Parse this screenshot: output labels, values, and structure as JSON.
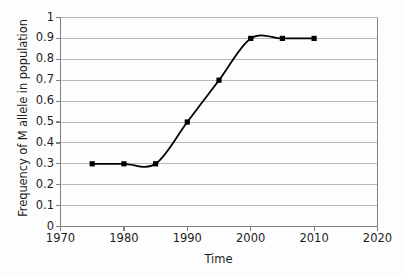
{
  "chart_data": {
    "type": "line",
    "title": "",
    "xlabel": "Time",
    "ylabel": "Frequency of M allele in population",
    "xlim": [
      1970,
      2020
    ],
    "ylim": [
      0,
      1
    ],
    "grid": true,
    "grid_axis": "y",
    "legend": "none",
    "smoothing": "spline",
    "marker": "filled-square",
    "marker_color": "#000000",
    "line_color": "#000000",
    "gridline_color": "#b9b9b9",
    "axis_color": "#808080",
    "background_color": "#ffffff",
    "x": [
      1975,
      1980,
      1985,
      1990,
      1995,
      2000,
      2005,
      2010
    ],
    "values": [
      0.3,
      0.3,
      0.3,
      0.5,
      0.7,
      0.9,
      0.9,
      0.9
    ],
    "series": [
      {
        "name": "Frequency of M allele",
        "points": [
          {
            "x": 1975,
            "y": 0.3
          },
          {
            "x": 1980,
            "y": 0.3
          },
          {
            "x": 1985,
            "y": 0.3
          },
          {
            "x": 1990,
            "y": 0.5
          },
          {
            "x": 1995,
            "y": 0.7
          },
          {
            "x": 2000,
            "y": 0.9
          },
          {
            "x": 2005,
            "y": 0.9
          },
          {
            "x": 2010,
            "y": 0.9
          }
        ]
      }
    ],
    "xticks": [
      1970,
      1980,
      1990,
      2000,
      2010,
      2020
    ],
    "xtick_labels": [
      "1970",
      "1980",
      "1990",
      "2000",
      "2010",
      "2020"
    ],
    "yticks": [
      0,
      0.1,
      0.2,
      0.3,
      0.4,
      0.5,
      0.6,
      0.7,
      0.8,
      0.9,
      1
    ],
    "ytick_labels": [
      "0",
      "0.1",
      "0.2",
      "0.3",
      "0.4",
      "0.5",
      "0.6",
      "0.7",
      "0.8",
      "0.9",
      "1"
    ]
  }
}
